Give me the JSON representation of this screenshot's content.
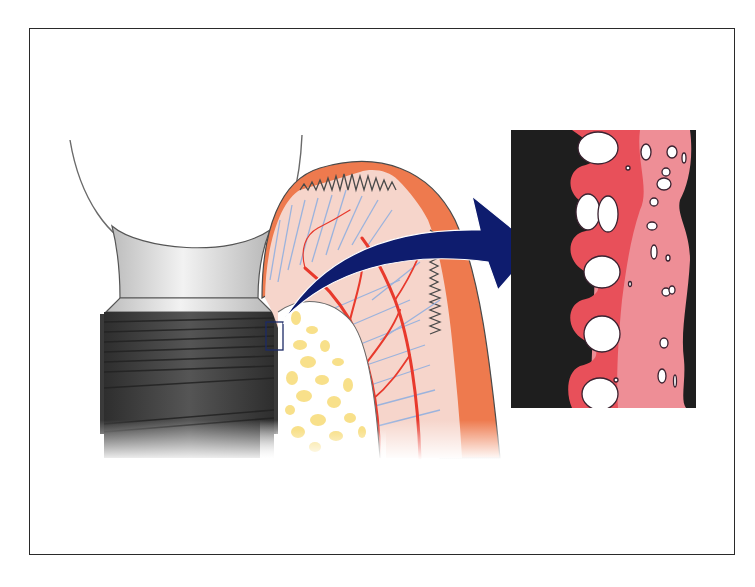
{
  "figure": {
    "type": "anatomical-illustration",
    "labels": [],
    "parts": [
      {
        "id": "abutment",
        "name": "implant abutment"
      },
      {
        "id": "implant-body",
        "name": "threaded implant body"
      },
      {
        "id": "gingiva",
        "name": "gingival soft tissue"
      },
      {
        "id": "cancellous-bone",
        "name": "cancellous bone"
      },
      {
        "id": "blood-vessels",
        "name": "blood vessels"
      },
      {
        "id": "detail-marker",
        "name": "magnification marker box"
      },
      {
        "id": "magnify-arrow",
        "name": "magnification arrow"
      },
      {
        "id": "magnified-interface",
        "name": "magnified bone-implant interface"
      }
    ]
  },
  "colors": {
    "frame": "#2a2a2a",
    "gingiva_outer": "#EE7A4E",
    "gingiva_inner": "#F6D5CB",
    "fibers": "#9BB3DD",
    "vessels": "#E8392C",
    "bone_yellow": "#F8E08A",
    "implant_dark": "#3E3E3E",
    "abutment_gray": "#D9D9D9",
    "arrow_navy": "#0E1C6E",
    "interface_red": "#E8505A",
    "interface_pink": "#EE8E96",
    "outline": "#4a4a4a"
  }
}
